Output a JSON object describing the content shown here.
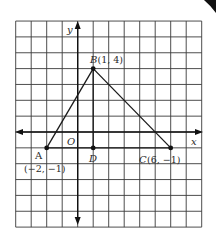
{
  "diagram": {
    "type": "coordinate-plane-triangle",
    "grid": {
      "x_min": -4,
      "x_max": 8,
      "y_min": -6,
      "y_max": 7,
      "origin_px": [
        77.7,
        132
      ],
      "cell_w": 15.5,
      "cell_h": 15.85,
      "line_color": "#3a3a3a"
    },
    "axes": {
      "x_label": "x",
      "y_label": "y",
      "origin_label": "O"
    },
    "points": [
      {
        "id": "A",
        "name": "A",
        "coord_label": "(−2, −1)",
        "x": -2,
        "y": -1
      },
      {
        "id": "B",
        "name": "B",
        "coord_label": "(1, 4)",
        "x": 1,
        "y": 4
      },
      {
        "id": "C",
        "name": "C",
        "coord_label": "(6, −1)",
        "x": 6,
        "y": -1
      },
      {
        "id": "D",
        "name": "D",
        "coord_label": "",
        "x": 1,
        "y": -1
      }
    ],
    "labels": {
      "A_name": "A",
      "A_coord": "(−2, −1)",
      "B_full": "B",
      "B_coord": "(1, 4)",
      "C_full": "C",
      "C_coord": "(6, −1)",
      "D_name": "D"
    },
    "segments": [
      [
        "A",
        "B"
      ],
      [
        "B",
        "C"
      ],
      [
        "A",
        "C"
      ],
      [
        "B",
        "D"
      ]
    ],
    "stroke_color": "#1a1a1a"
  }
}
